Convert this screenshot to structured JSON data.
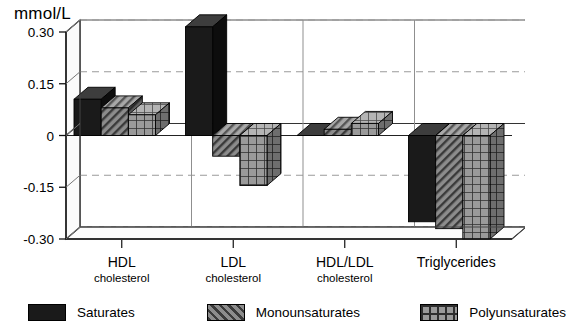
{
  "chart_data": {
    "type": "bar",
    "title": "",
    "ylabel": "mmol/L",
    "xlabel": "",
    "ylim": [
      -0.3,
      0.3
    ],
    "yticks": [
      0.3,
      0.15,
      0,
      -0.15,
      -0.3
    ],
    "ytick_labels": [
      "0.30",
      "0.15",
      "0",
      "-0.15",
      "-0.30"
    ],
    "grid": true,
    "legend_position": "bottom",
    "style": "3d-grouped-bars",
    "categories": [
      "HDL cholesterol",
      "LDL cholesterol",
      "HDL/LDL cholesterol",
      "Triglycerides"
    ],
    "category_labels": [
      {
        "main": "HDL",
        "sub": "cholesterol"
      },
      {
        "main": "LDL",
        "sub": "cholesterol"
      },
      {
        "main": "HDL/LDL",
        "sub": "cholesterol"
      },
      {
        "main": "Triglycerides",
        "sub": ""
      }
    ],
    "series": [
      {
        "name": "Saturates",
        "pattern": "solid-black",
        "color": "#1a1a1a",
        "values": [
          0.105,
          0.315,
          0.0,
          -0.25
        ]
      },
      {
        "name": "Monounsaturates",
        "pattern": "diagonal-hatch",
        "color": "#7d7d7d",
        "values": [
          0.08,
          -0.06,
          0.018,
          -0.27
        ]
      },
      {
        "name": "Polyunsaturates",
        "pattern": "grid-hatch",
        "color": "#8a8a8a",
        "values": [
          0.06,
          -0.145,
          0.035,
          -0.3
        ]
      }
    ]
  },
  "legend": {
    "items": [
      {
        "label": "Saturates"
      },
      {
        "label": "Monounsaturates"
      },
      {
        "label": "Polyunsaturates"
      }
    ]
  },
  "axis": {
    "unit_label": "mmol/L"
  }
}
